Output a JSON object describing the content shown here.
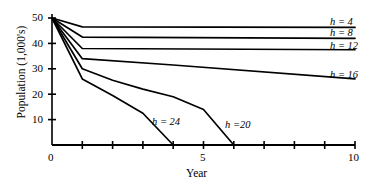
{
  "chart_data": {
    "type": "line",
    "title": "",
    "xlabel": "Year",
    "ylabel": "Population (1,000's)",
    "xlim": [
      0,
      10
    ],
    "ylim": [
      0,
      50
    ],
    "xticks": [
      0,
      1,
      2,
      3,
      4,
      5,
      6,
      7,
      8,
      9,
      10
    ],
    "xticklabels": [
      "0",
      "",
      "",
      "",
      "",
      "5",
      "",
      "",
      "",
      "",
      "10"
    ],
    "yticks": [
      0,
      10,
      20,
      30,
      40,
      50
    ],
    "yticklabels": [
      "",
      "10",
      "20",
      "30",
      "40",
      "50"
    ],
    "grid": false,
    "legend_position": "right-of-line-ends",
    "series": [
      {
        "name": "h = 4",
        "label": "h = 4",
        "x": [
          0,
          1,
          10
        ],
        "y": [
          50,
          46.5,
          46.3
        ]
      },
      {
        "name": "h = 8",
        "label": "h = 8",
        "x": [
          0,
          1,
          10
        ],
        "y": [
          50,
          42.5,
          42.0
        ]
      },
      {
        "name": "h = 12",
        "label": "h = 12",
        "x": [
          0,
          1,
          10
        ],
        "y": [
          50,
          38.0,
          37.5
        ]
      },
      {
        "name": "h = 16",
        "label": "h = 16",
        "x": [
          0,
          1,
          4,
          10
        ],
        "y": [
          50,
          34.0,
          31.5,
          26.0
        ]
      },
      {
        "name": "h = 20",
        "label": "h =20",
        "x": [
          0,
          1,
          2,
          3,
          4,
          5,
          6
        ],
        "y": [
          50,
          30.0,
          25.5,
          22.0,
          19.0,
          14.0,
          0
        ]
      },
      {
        "name": "h = 24",
        "label": "h = 24",
        "x": [
          0,
          1,
          2,
          3,
          4
        ],
        "y": [
          50,
          26.0,
          19.5,
          12.5,
          0
        ]
      }
    ],
    "annotations": [
      {
        "text": "h = 24",
        "x": 3.4,
        "y": 8.5,
        "series": "h = 24"
      },
      {
        "text": "h =20",
        "x": 5.7,
        "y": 7.5,
        "series": "h = 20"
      }
    ],
    "end_labels": [
      {
        "text": "h = 4",
        "x": 10.3,
        "y": 46.3
      },
      {
        "text": "h = 8",
        "x": 10.3,
        "y": 42.0
      },
      {
        "text": "h = 12",
        "x": 10.3,
        "y": 37.5
      },
      {
        "text": "h = 16",
        "x": 10.3,
        "y": 26.0
      }
    ],
    "colors": {
      "line": "#000000",
      "axis": "#000000",
      "background": "#ffffff"
    }
  },
  "axis": {
    "x_title": "Year",
    "y_title": "Population (1,000's)",
    "x_labels": {
      "zero": "0",
      "five": "5",
      "ten": "10"
    },
    "y_labels": {
      "ten": "10",
      "twenty": "20",
      "thirty": "30",
      "forty": "40",
      "fifty": "50"
    }
  },
  "labels": {
    "h4": "h = 4",
    "h8": "h = 8",
    "h12": "h = 12",
    "h16": "h = 16",
    "h20": "h =20",
    "h24": "h = 24"
  }
}
